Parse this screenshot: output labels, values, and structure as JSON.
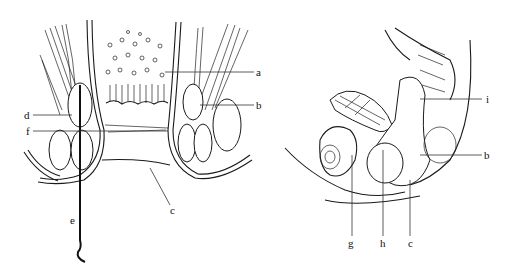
{
  "figure": {
    "left_panel": {
      "description": "coronal section of anal canal with probe",
      "labels": [
        {
          "id": "a",
          "text": "a",
          "x": 258,
          "y": 74
        },
        {
          "id": "b",
          "text": "b",
          "x": 258,
          "y": 107
        },
        {
          "id": "d",
          "text": "d",
          "x": 26,
          "y": 117
        },
        {
          "id": "f",
          "text": "f",
          "x": 26,
          "y": 133
        },
        {
          "id": "c",
          "text": "c",
          "x": 170,
          "y": 214
        },
        {
          "id": "e",
          "text": "e",
          "x": 70,
          "y": 222
        }
      ]
    },
    "right_panel": {
      "description": "sagittal section of female pelvis",
      "labels": [
        {
          "id": "i",
          "text": "i",
          "x": 486,
          "y": 101
        },
        {
          "id": "b",
          "text": "b",
          "x": 486,
          "y": 157
        },
        {
          "id": "g",
          "text": "g",
          "x": 350,
          "y": 245
        },
        {
          "id": "h",
          "text": "h",
          "x": 382,
          "y": 245
        },
        {
          "id": "c",
          "text": "c",
          "x": 410,
          "y": 245
        }
      ]
    }
  }
}
